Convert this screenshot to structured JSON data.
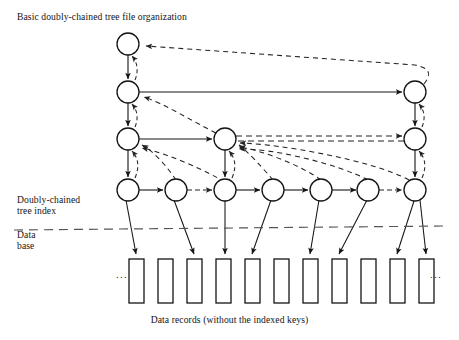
{
  "figure": {
    "title": "Basic doubly-chained tree file organization",
    "caption": "Data records (without the indexed keys)",
    "index_region_label_line1": "Doubly-chained",
    "index_region_label_line2": "tree index",
    "data_region_label_line1": "Data",
    "data_region_label_line2": "base",
    "ellipsis_left": "...",
    "ellipsis_right": "...",
    "colors": {
      "ink": "#141414",
      "background": "#ffffff",
      "node_stroke": "#141414",
      "solid_link": "#141414",
      "dashed_link": "#2b2b2b",
      "separator": "#555555",
      "record_stroke": "#141414"
    }
  },
  "diagram": {
    "type": "doubly-chained-tree",
    "node_radius": 11,
    "levels": [
      {
        "level": 1,
        "y": 44,
        "node_x": [
          128
        ]
      },
      {
        "level": 2,
        "y": 92,
        "node_x": [
          128,
          415
        ]
      },
      {
        "level": 3,
        "y": 139,
        "node_x": [
          128,
          225,
          415
        ]
      },
      {
        "level": 4,
        "y": 190,
        "node_x": [
          128,
          176,
          225,
          273,
          321,
          368,
          415
        ]
      }
    ],
    "separator_y": 228,
    "records": {
      "count": 11,
      "y_top": 259,
      "y_bottom": 303,
      "width": 15,
      "x_left": [
        129,
        158,
        187,
        216,
        245,
        274,
        303,
        332,
        361,
        390,
        419
      ]
    },
    "leaf_record_targets": [
      0,
      1,
      2,
      3,
      4,
      6,
      7,
      9
    ],
    "solid_child_links": "parent node down to first child of next level",
    "dashed_parent_links": "child back-pointers returning to parent node"
  }
}
